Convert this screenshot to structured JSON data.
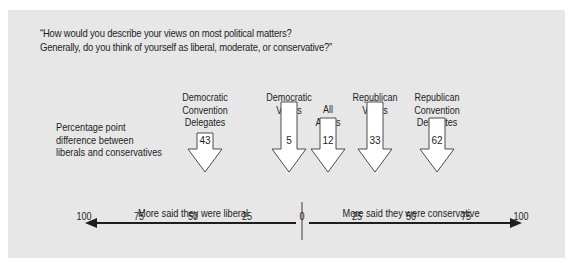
{
  "question": {
    "line1": "“How would you describe your views on most political matters?",
    "line2": "Generally, do you think of yourself as liberal, moderate, or conservative?”"
  },
  "measure_label": {
    "line1": "Percentage point",
    "line2": "difference between",
    "line3": "liberals and conservatives"
  },
  "groups": [
    {
      "label_lines": [
        "Democratic",
        "Convention",
        "Delegates"
      ],
      "value": "43",
      "direction": "liberal"
    },
    {
      "label_lines": [
        "Democratic",
        "Voters"
      ],
      "value": "5",
      "direction": "conservative"
    },
    {
      "label_lines": [
        "All",
        "Adults"
      ],
      "value": "12",
      "direction": "conservative"
    },
    {
      "label_lines": [
        "Republican",
        "Voters"
      ],
      "value": "33",
      "direction": "conservative"
    },
    {
      "label_lines": [
        "Republican",
        "Convention",
        "Delegates"
      ],
      "value": "62",
      "direction": "conservative"
    }
  ],
  "axis": {
    "ticks": [
      "100",
      "75",
      "50",
      "25",
      "0",
      "25",
      "50",
      "75",
      "100"
    ],
    "left_label": "More said they were liberal",
    "right_label": "More said they were conservative"
  },
  "colors": {
    "panel_bg": "#e6e7e6",
    "arrow_fill": "#ffffff",
    "arrow_stroke": "#3a3a3a",
    "text": "#1e1e1e"
  }
}
